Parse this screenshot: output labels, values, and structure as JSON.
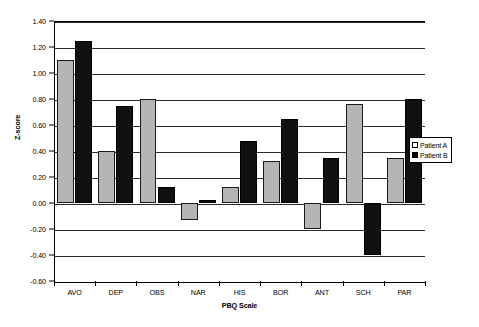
{
  "chart_data": {
    "type": "bar",
    "title": "",
    "xlabel": "PBQ Scale",
    "ylabel": "Z-score",
    "categories": [
      "AVO",
      "DEP",
      "OBS",
      "NAR",
      "HIS",
      "BOR",
      "ANT",
      "SCH",
      "PAR"
    ],
    "series": [
      {
        "name": "Patient A",
        "color": "#b5b5b5",
        "values": [
          1.1,
          0.4,
          0.8,
          -0.13,
          0.12,
          0.32,
          -0.2,
          0.76,
          0.35
        ]
      },
      {
        "name": "Patient B",
        "color": "#101010",
        "values": [
          1.25,
          0.75,
          0.12,
          0.02,
          0.48,
          0.65,
          0.35,
          -0.4,
          0.8
        ]
      }
    ],
    "ylim": [
      -0.6,
      1.4
    ],
    "ytick_step": 0.2,
    "ytick_labels": [
      "1.40",
      "1.20",
      "1.00",
      "0.80",
      "0.60",
      "0.40",
      "0.20",
      "0.00",
      "-0.20",
      "-0.40",
      "-0.60"
    ],
    "ytick_values": [
      1.4,
      1.2,
      1.0,
      0.8,
      0.6,
      0.4,
      0.2,
      0.0,
      -0.2,
      -0.4,
      -0.6
    ],
    "grid": true,
    "legend_position": "right"
  },
  "legend": {
    "entries": [
      {
        "label": "Patient A"
      },
      {
        "label": "Patient B"
      }
    ]
  }
}
